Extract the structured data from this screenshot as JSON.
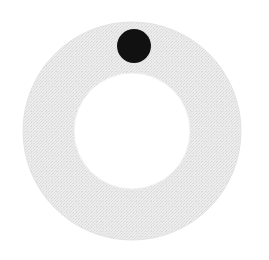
{
  "canvas": {
    "width": 269,
    "height": 260,
    "background_color": "#ffffff",
    "title": "Annulus with marker dot"
  },
  "shapes": {
    "annulus": {
      "name": "ring",
      "center_x": 132,
      "center_y": 131,
      "outer_radius": 109,
      "inner_radius": 58,
      "fill_color": "#e9e9e9",
      "edge_color": "#e3e3e3",
      "texture": "halftone-dither",
      "texture_dot_color": "#dcdcdc",
      "texture_spacing": 3
    },
    "marker_dot": {
      "name": "dot",
      "center_x": 134,
      "center_y": 46,
      "radius": 17,
      "fill_color": "#111111"
    },
    "hole": {
      "name": "inner-hole",
      "center_x": 132,
      "center_y": 131,
      "radius": 58,
      "fill_color": "#ffffff"
    }
  },
  "chart_data": {
    "type": "scatter",
    "xlabel": "",
    "ylabel": "",
    "xlim": [
      0,
      269
    ],
    "ylim": [
      0,
      260
    ],
    "grid": false,
    "legend": "none",
    "series": [
      {
        "name": "annulus",
        "shape": "ring",
        "values": [
          {
            "cx": 132,
            "cy": 131,
            "r_outer": 109,
            "r_inner": 58,
            "color": "#e9e9e9"
          }
        ]
      },
      {
        "name": "marker",
        "shape": "circle",
        "values": [
          {
            "cx": 134,
            "cy": 46,
            "r": 17,
            "color": "#111111"
          }
        ]
      }
    ]
  }
}
